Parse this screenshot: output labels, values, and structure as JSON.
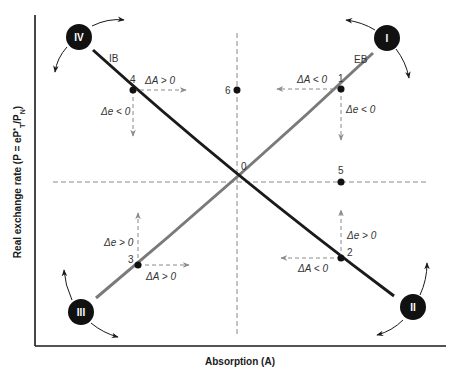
{
  "figure": {
    "x_axis_label": "Absorption (A)",
    "y_axis_label": "Real exchange rate (P = eP",
    "y_axis_label_sup": "*",
    "y_axis_label_sub": "T",
    "y_axis_label_tail": "/P",
    "y_axis_label_sub2": "N",
    "y_axis_label_close": ")",
    "curves": {
      "ib": {
        "label": "IB",
        "color": "#1a1a1a"
      },
      "eb": {
        "label": "EB",
        "color": "#7a7a7a"
      }
    },
    "origin_label": "0",
    "zones": [
      {
        "id": "I",
        "label": "I"
      },
      {
        "id": "II",
        "label": "II"
      },
      {
        "id": "III",
        "label": "III"
      },
      {
        "id": "IV",
        "label": "IV"
      }
    ],
    "points": [
      {
        "id": "1",
        "label": "1",
        "dA": "ΔA < 0",
        "de": "Δe < 0"
      },
      {
        "id": "2",
        "label": "2",
        "dA": "ΔA < 0",
        "de": "Δe > 0"
      },
      {
        "id": "3",
        "label": "3",
        "dA": "ΔA > 0",
        "de": "Δe > 0"
      },
      {
        "id": "4",
        "label": "4",
        "dA": "ΔA > 0",
        "de": "Δe < 0"
      },
      {
        "id": "5",
        "label": "5"
      },
      {
        "id": "6",
        "label": "6"
      }
    ],
    "colors": {
      "axis": "#1a1a1a",
      "ib_line": "#1a1a1a",
      "eb_line": "#7a7a7a",
      "dashed": "#8a8a8a",
      "zone_fill": "#111111",
      "zone_text": "#ffffff"
    }
  }
}
